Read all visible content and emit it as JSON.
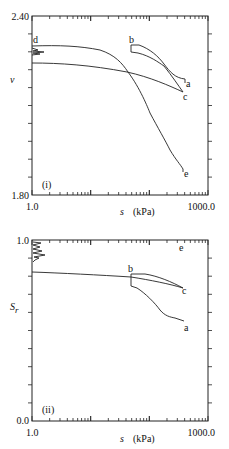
{
  "chart_data": [
    {
      "panel": "(i)",
      "type": "line",
      "xscale": "log",
      "xlabel": "s (kPa)",
      "ylabel": "v",
      "xlim": [
        1.0,
        1000.0
      ],
      "ylim": [
        1.8,
        2.4
      ],
      "x_tick_labels": [
        "1.0",
        "1000.0"
      ],
      "y_tick_labels": [
        "1.80",
        "2.40"
      ],
      "grid": false,
      "annotations": [
        "a",
        "b",
        "c",
        "d",
        "e",
        "(i)"
      ],
      "series": [
        {
          "name": "d-c (drying path from d)",
          "x": [
            1.0,
            3.0,
            10.0,
            30.0,
            41.0,
            100.0,
            200.0,
            370.0
          ],
          "y": [
            2.24,
            2.237,
            2.23,
            2.215,
            2.21,
            2.18,
            2.16,
            2.145
          ]
        },
        {
          "name": "d-e (upper curve to e)",
          "x": [
            1.0,
            3.0,
            5.0,
            10.0,
            20.0,
            41.0,
            70.0,
            120.0,
            200.0,
            370.0
          ],
          "y": [
            2.3,
            2.3,
            2.295,
            2.28,
            2.255,
            2.21,
            2.14,
            2.06,
            1.97,
            1.89
          ]
        },
        {
          "name": "b-a (loop upper branch)",
          "x": [
            48.0,
            60.0,
            100.0,
            150.0,
            250.0,
            400.0
          ],
          "y": [
            2.3,
            2.3,
            2.28,
            2.245,
            2.185,
            2.175
          ]
        },
        {
          "name": "b-c (loop lower branch)",
          "x": [
            48.0,
            48.0,
            60.0,
            100.0,
            150.0,
            250.0,
            370.0
          ],
          "y": [
            2.3,
            2.275,
            2.27,
            2.25,
            2.22,
            2.175,
            2.145
          ]
        }
      ]
    },
    {
      "panel": "(ii)",
      "type": "line",
      "xscale": "log",
      "xlabel": "s (kPa)",
      "ylabel": "Sr",
      "xlim": [
        1.0,
        1000.0
      ],
      "ylim": [
        0.0,
        1.0
      ],
      "x_tick_labels": [
        "1.0",
        "1000.0"
      ],
      "y_tick_labels": [
        "0.0",
        "1.0"
      ],
      "grid": false,
      "annotations": [
        "a",
        "b",
        "c",
        "e",
        "(ii)"
      ],
      "series": [
        {
          "name": "main path to c",
          "x": [
            1.0,
            5.0,
            20.0,
            48.0,
            100.0,
            200.0,
            370.0
          ],
          "y": [
            0.82,
            0.815,
            0.805,
            0.795,
            0.78,
            0.76,
            0.735
          ]
        },
        {
          "name": "b-c upper",
          "x": [
            48.0,
            70.0,
            120.0,
            200.0,
            370.0
          ],
          "y": [
            0.81,
            0.81,
            0.795,
            0.77,
            0.735
          ]
        },
        {
          "name": "b-a",
          "x": [
            48.0,
            48.0,
            60.0,
            100.0,
            150.0,
            200.0,
            400.0
          ],
          "y": [
            0.81,
            0.74,
            0.73,
            0.67,
            0.6,
            0.57,
            0.55
          ]
        }
      ]
    }
  ],
  "labels": {
    "top": {
      "ymax": "2.40",
      "ymin": "1.80",
      "xmin": "1.0",
      "xmax": "1000.0",
      "ylabel": "v",
      "xlabel_sym": "s",
      "xlabel_unit": "(kPa)",
      "panel": "(i)",
      "pt_a": "a",
      "pt_b": "b",
      "pt_c": "c",
      "pt_d": "d",
      "pt_e": "e"
    },
    "bottom": {
      "ymax": "1.0",
      "ymin": "0.0",
      "xmin": "1.0",
      "xmax": "1000.0",
      "ylabel_main": "S",
      "ylabel_sub": "r",
      "xlabel_sym": "s",
      "xlabel_unit": "(kPa)",
      "panel": "(ii)",
      "pt_a": "a",
      "pt_b": "b",
      "pt_c": "c",
      "pt_e": "e"
    }
  }
}
